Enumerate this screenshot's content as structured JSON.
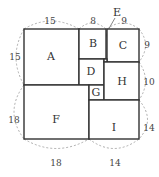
{
  "diagram": {
    "squares": [
      {
        "label": "A",
        "side": 15
      },
      {
        "label": "B",
        "side": 8
      },
      {
        "label": "C",
        "side": 9
      },
      {
        "label": "D",
        "side": 7
      },
      {
        "label": "E",
        "side": 1
      },
      {
        "label": "F",
        "side": 18
      },
      {
        "label": "G",
        "side": 4
      },
      {
        "label": "H",
        "side": 10
      },
      {
        "label": "I",
        "side": 14
      }
    ],
    "dimensions": {
      "top_a": "15",
      "top_b": "8",
      "top_c": "9",
      "left_a": "15",
      "right_c": "9",
      "right_h": "10",
      "left_f": "18",
      "right_i": "14",
      "bottom_f": "18",
      "bottom_i": "14"
    }
  }
}
